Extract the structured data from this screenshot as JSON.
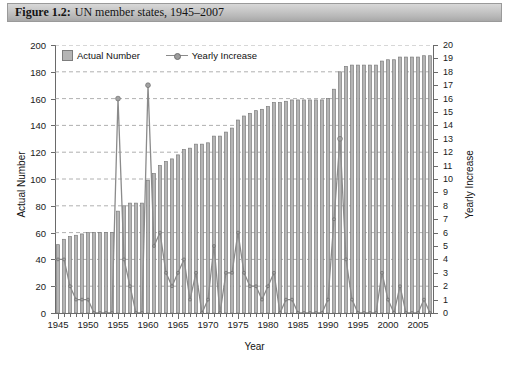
{
  "figure": {
    "label": "Figure 1.2:",
    "caption": "UN member states, 1945–2007"
  },
  "legend": {
    "position": "top-left-inside",
    "items": [
      {
        "name": "Actual Number",
        "marker": "square-swatch",
        "color": "#b5b5b5"
      },
      {
        "name": "Yearly Increase",
        "marker": "line-with-dot",
        "color": "#8b8b8b"
      }
    ]
  },
  "axes": {
    "left": {
      "title": "Actual Number",
      "min": 0,
      "max": 200,
      "step": 20,
      "ticks": [
        0,
        20,
        40,
        60,
        80,
        100,
        120,
        140,
        160,
        180,
        200
      ]
    },
    "right": {
      "title": "Yearly Increase",
      "min": 0,
      "max": 20,
      "step": 1,
      "ticks": [
        0,
        1,
        2,
        3,
        4,
        5,
        6,
        7,
        8,
        9,
        10,
        11,
        12,
        13,
        14,
        15,
        16,
        17,
        18,
        19,
        20
      ]
    },
    "bottom": {
      "title": "Year",
      "min": 1945,
      "max": 2007,
      "step": 5,
      "ticks": [
        1945,
        1950,
        1955,
        1960,
        1965,
        1970,
        1975,
        1980,
        1985,
        1990,
        1995,
        2000,
        2005
      ]
    }
  },
  "chart_data": {
    "type": "bar",
    "title": "UN member states, 1945–2007",
    "xlabel": "Year",
    "ylabel": "Actual Number",
    "y2label": "Yearly Increase",
    "ylim": [
      0,
      200
    ],
    "y2lim": [
      0,
      20
    ],
    "xlim": [
      1945,
      2007
    ],
    "grid": "horizontal-dashed",
    "legend_position": "top-left-inside",
    "categories": [
      1945,
      1946,
      1947,
      1948,
      1949,
      1950,
      1951,
      1952,
      1953,
      1954,
      1955,
      1956,
      1957,
      1958,
      1959,
      1960,
      1961,
      1962,
      1963,
      1964,
      1965,
      1966,
      1967,
      1968,
      1969,
      1970,
      1971,
      1972,
      1973,
      1974,
      1975,
      1976,
      1977,
      1978,
      1979,
      1980,
      1981,
      1982,
      1983,
      1984,
      1985,
      1986,
      1987,
      1988,
      1989,
      1990,
      1991,
      1992,
      1993,
      1994,
      1995,
      1996,
      1997,
      1998,
      1999,
      2000,
      2001,
      2002,
      2003,
      2004,
      2005,
      2006,
      2007
    ],
    "series": [
      {
        "name": "Actual Number",
        "axis": "left",
        "type": "bar",
        "color": "#b5b5b5",
        "edge_color": "#7d7d7d",
        "values": [
          51,
          55,
          57,
          58,
          59,
          60,
          60,
          60,
          60,
          60,
          76,
          80,
          82,
          82,
          82,
          99,
          104,
          110,
          113,
          115,
          118,
          122,
          123,
          126,
          126,
          127,
          132,
          132,
          135,
          138,
          144,
          147,
          149,
          151,
          152,
          154,
          157,
          157,
          158,
          159,
          159,
          159,
          159,
          159,
          159,
          160,
          167,
          180,
          184,
          185,
          185,
          185,
          185,
          185,
          188,
          189,
          189,
          191,
          191,
          191,
          191,
          192,
          192
        ]
      },
      {
        "name": "Yearly Increase",
        "axis": "right",
        "type": "line",
        "color": "#8b8b8b",
        "marker": "circle",
        "values": [
          4,
          4,
          2,
          1,
          1,
          1,
          0,
          0,
          0,
          0,
          16,
          4,
          2,
          0,
          0,
          17,
          5,
          6,
          3,
          2,
          3,
          4,
          1,
          3,
          0,
          1,
          5,
          0,
          3,
          3,
          6,
          3,
          2,
          2,
          1,
          2,
          3,
          0,
          1,
          1,
          0,
          0,
          0,
          0,
          0,
          1,
          7,
          13,
          4,
          1,
          0,
          0,
          0,
          0,
          3,
          1,
          0,
          2,
          0,
          0,
          0,
          1,
          0
        ]
      }
    ]
  }
}
